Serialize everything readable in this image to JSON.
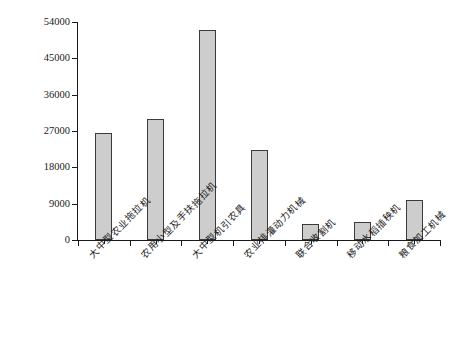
{
  "chart_data": {
    "type": "bar",
    "title": "",
    "xlabel": "",
    "ylabel": "数量(台、部)",
    "ylim": [
      0,
      54000
    ],
    "grid": false,
    "legend": null,
    "ytick_labels": [
      "54000",
      "45000",
      "36000",
      "27000",
      "18000",
      "9000",
      "0"
    ],
    "ytick_values": [
      54000,
      45000,
      36000,
      27000,
      18000,
      9000,
      0
    ],
    "categories": [
      "大中型农业拖拉机",
      "农用小型及手扶拖拉机",
      "大中型机引农具",
      "农业排灌动力机械",
      "联合收割机",
      "移动水稻插秧机",
      "粮食加工机械"
    ],
    "values": [
      26500,
      30000,
      52000,
      22300,
      4000,
      4500,
      9900
    ],
    "bar_fill_color": "#cdcdcd",
    "bar_border_color": "#3b3b3b",
    "axis_color": "#1a1a1a",
    "background_color": "#ffffff"
  }
}
